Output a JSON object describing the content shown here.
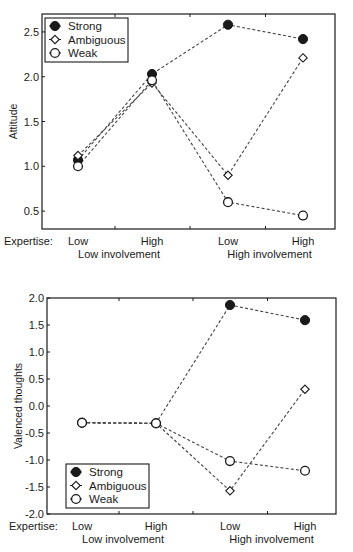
{
  "chart_data": [
    {
      "type": "line",
      "title": "",
      "xlabel_prefix": "Expertise:",
      "ylabel": "Attitude",
      "categories": [
        "Low",
        "High",
        "Low",
        "High"
      ],
      "group_labels": [
        "Low involvement",
        "High involvement"
      ],
      "ylim": [
        0.3,
        2.7
      ],
      "yticks": [
        0.5,
        1.0,
        1.5,
        2.0,
        2.5
      ],
      "ytick_labels": [
        "0.5",
        "1.0",
        "1.5",
        "2.0",
        "2.5"
      ],
      "grid": false,
      "legend_position": "upper-left",
      "line_style": "dashed",
      "series": [
        {
          "name": "Strong",
          "marker": "filled-circle",
          "values": [
            1.07,
            2.03,
            2.58,
            2.42
          ]
        },
        {
          "name": "Ambiguous",
          "marker": "open-diamond",
          "values": [
            1.12,
            1.93,
            0.9,
            2.21
          ]
        },
        {
          "name": "Weak",
          "marker": "open-circle",
          "values": [
            1.0,
            1.96,
            0.6,
            0.45
          ]
        }
      ]
    },
    {
      "type": "line",
      "title": "",
      "xlabel_prefix": "Expertise:",
      "ylabel": "Valenced thoughts",
      "categories": [
        "Low",
        "High",
        "Low",
        "High"
      ],
      "group_labels": [
        "Low involvement",
        "High involvement"
      ],
      "ylim": [
        -2.0,
        2.0
      ],
      "yticks": [
        -2.0,
        -1.5,
        -1.0,
        -0.5,
        0.0,
        0.5,
        1.0,
        1.5,
        2.0
      ],
      "ytick_labels": [
        "-2.0",
        "-1.5",
        "-1.0",
        "-0.5",
        "0.0",
        "0.5",
        "1.0",
        "1.5",
        "2.0"
      ],
      "grid": false,
      "legend_position": "lower-left",
      "line_style": "dashed",
      "series": [
        {
          "name": "Strong",
          "marker": "filled-circle",
          "values": [
            -0.31,
            -0.32,
            1.87,
            1.59
          ]
        },
        {
          "name": "Ambiguous",
          "marker": "open-diamond",
          "values": [
            -0.31,
            -0.32,
            -1.57,
            0.31
          ]
        },
        {
          "name": "Weak",
          "marker": "open-circle",
          "values": [
            -0.31,
            -0.32,
            -1.02,
            -1.2
          ]
        }
      ]
    }
  ],
  "layout": {
    "top": {
      "plot": {
        "x0": 42,
        "x1": 335,
        "y0": 14,
        "y1": 229
      },
      "xpos": [
        78,
        152,
        228,
        303
      ],
      "legend": {
        "x": 45,
        "y": 18
      }
    },
    "bottom": {
      "plot": {
        "x0": 47,
        "x1": 336,
        "y0": 15,
        "y1": 231
      },
      "xpos": [
        82,
        156,
        230,
        305
      ],
      "legend": {
        "x": 66,
        "y": 181
      }
    }
  },
  "colors": {
    "ink": "#1a1a1a",
    "line": "#444444",
    "background": "#ffffff"
  }
}
